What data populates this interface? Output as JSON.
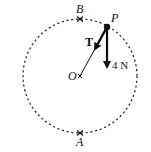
{
  "diagram": {
    "type": "vertical-circle-mechanics",
    "circle": {
      "center": "O",
      "style": "dashed"
    },
    "points": {
      "top": "B",
      "bottom": "A",
      "center": "O",
      "particle": "P"
    },
    "forces": [
      {
        "label": "T",
        "direction": "from P toward O",
        "style": "bold"
      },
      {
        "label": "4 N",
        "direction": "vertically downward from P"
      }
    ],
    "colors": {
      "ink": "#111111",
      "background": "#ffffff"
    }
  },
  "labels": {
    "B": "B",
    "A": "A",
    "O": "O",
    "P": "P",
    "T": "T",
    "weight": "4 N"
  }
}
